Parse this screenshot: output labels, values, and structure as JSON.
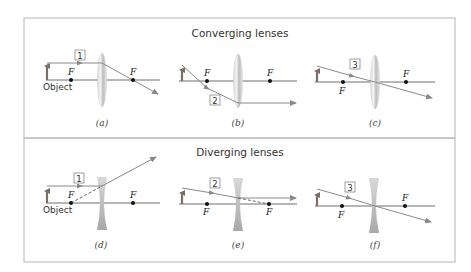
{
  "sections": [
    {
      "id": "converging",
      "title": "Converging lenses",
      "panels": [
        {
          "caption": "(a)",
          "ray_number": "1",
          "object_label": "Object",
          "focal_labels": [
            "F",
            "F"
          ]
        },
        {
          "caption": "(b)",
          "ray_number": "2",
          "focal_labels": [
            "F",
            "F"
          ]
        },
        {
          "caption": "(c)",
          "ray_number": "3",
          "focal_labels": [
            "F",
            "F"
          ]
        }
      ]
    },
    {
      "id": "diverging",
      "title": "Diverging lenses",
      "panels": [
        {
          "caption": "(d)",
          "ray_number": "1",
          "object_label": "Object",
          "focal_labels": [
            "F",
            "F"
          ]
        },
        {
          "caption": "(e)",
          "ray_number": "2",
          "focal_labels": [
            "F",
            "F"
          ]
        },
        {
          "caption": "(f)",
          "ray_number": "3",
          "focal_labels": [
            "F",
            "F"
          ]
        }
      ]
    }
  ],
  "colors": {
    "frame": "#b5b5b5",
    "axis": "#6e6e6e",
    "ray": "#8a8a8a",
    "object_arrow": "#7a6e66",
    "lens": "#c8c8c8",
    "focal_point": "#111111"
  }
}
